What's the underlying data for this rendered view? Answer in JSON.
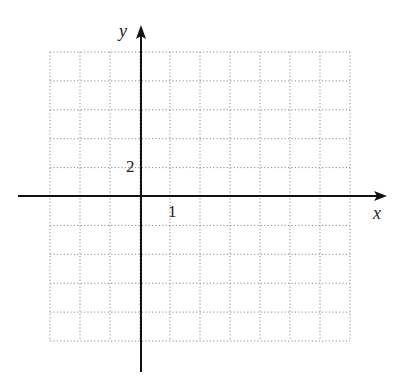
{
  "axes": {
    "x_label": "x",
    "y_label": "y",
    "x_tick_label": "1",
    "y_tick_label": "2"
  },
  "grid": {
    "columns": 10,
    "rows": 10,
    "left": 50,
    "right": 350,
    "top": 52,
    "bottom": 341,
    "line_color": "#888888"
  },
  "origin": {
    "x": 141,
    "y": 196
  }
}
